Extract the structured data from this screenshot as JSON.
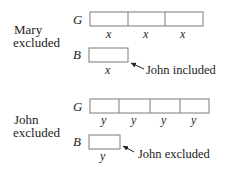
{
  "sections": [
    {
      "title_lines": [
        "Mary",
        "excluded"
      ],
      "g_label": "G",
      "g_cells": [
        "x",
        "x",
        "x"
      ],
      "b_label": "B",
      "b_cells": [
        "x"
      ],
      "annotation": "John included"
    },
    {
      "title_lines": [
        "John",
        "excluded"
      ],
      "g_label": "G",
      "g_cells": [
        "y",
        "y",
        "y",
        "y"
      ],
      "b_label": "B",
      "b_cells": [
        "y"
      ],
      "annotation": "John excluded"
    }
  ],
  "colors": {
    "text": "#222222",
    "box_stroke": "#7a7a7a",
    "background": "#ffffff"
  }
}
